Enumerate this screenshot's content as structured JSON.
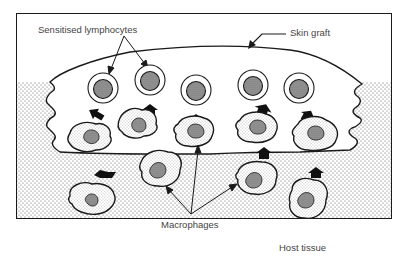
{
  "diagram": {
    "labels": {
      "sensitised_lymphocytes": "Sensitised lymphocytes",
      "skin_graft": "Skin graft",
      "macrophages": "Macrophages",
      "host_tissue": "Host tissue"
    },
    "colors": {
      "line": "#1a1a1a",
      "text": "#444444",
      "stipple": "#555555",
      "background": "#ffffff"
    },
    "lymphocyte_count": 5,
    "macrophage_count_in_graft": 5,
    "macrophage_count_in_host": 4,
    "arrow_count": 8
  }
}
